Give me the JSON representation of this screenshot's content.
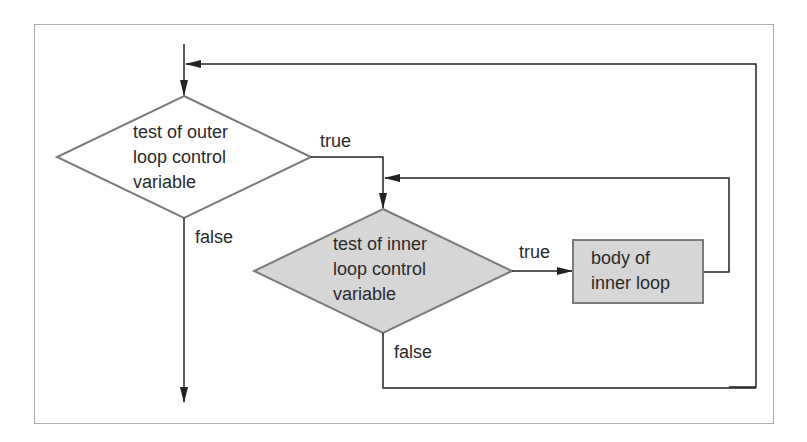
{
  "diagram": {
    "colors": {
      "frame": "#b0b0b0",
      "line": "#222222",
      "outer_diamond_fill": "#ffffff",
      "outer_diamond_stroke": "#7a7a7a",
      "inner_fill": "#d6d6d6",
      "inner_stroke": "#7a7a7a"
    },
    "nodes": {
      "outer_test": {
        "shape": "diamond",
        "line1": "test of outer",
        "line2": "loop control",
        "line3": "variable"
      },
      "inner_test": {
        "shape": "diamond",
        "line1": "test of inner",
        "line2": "loop control",
        "line3": "variable"
      },
      "inner_body": {
        "shape": "rectangle",
        "line1": "body of",
        "line2": "inner loop"
      }
    },
    "edges": {
      "outer_true": "true",
      "outer_false": "false",
      "inner_true": "true",
      "inner_false": "false"
    }
  }
}
